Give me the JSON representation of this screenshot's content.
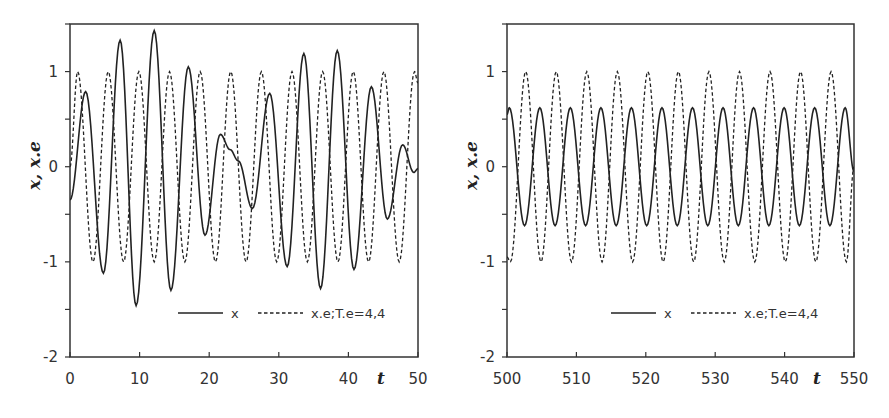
{
  "chart_data": [
    {
      "type": "line",
      "title": "",
      "xlabel": "t",
      "ylabel": "x, x.e",
      "xlim": [
        0,
        50
      ],
      "ylim": [
        -2,
        1.5
      ],
      "xticks": [
        0,
        10,
        20,
        30,
        40,
        50
      ],
      "yticks": [
        -2,
        -1,
        0,
        1
      ],
      "yminor_step": 0.5,
      "grid": false,
      "legend_position": "lower-right inside",
      "series": [
        {
          "name": "x",
          "style": "solid",
          "keyframes": [
            [
              0,
              -0.35
            ],
            [
              2.25,
              0.79
            ],
            [
              4.8,
              -1.12
            ],
            [
              7.2,
              1.33
            ],
            [
              9.5,
              -1.46
            ],
            [
              12.1,
              1.43
            ],
            [
              14.5,
              -1.3
            ],
            [
              17.0,
              1.05
            ],
            [
              19.4,
              -0.72
            ],
            [
              21.6,
              0.34
            ],
            [
              23.0,
              0.18
            ],
            [
              24.2,
              0.06
            ],
            [
              26.2,
              -0.44
            ],
            [
              28.7,
              0.77
            ],
            [
              31.2,
              -1.05
            ],
            [
              33.6,
              1.19
            ],
            [
              36.0,
              -1.28
            ],
            [
              38.4,
              1.22
            ],
            [
              40.8,
              -1.08
            ],
            [
              43.3,
              0.84
            ],
            [
              45.6,
              -0.55
            ],
            [
              47.8,
              0.23
            ],
            [
              49.4,
              -0.06
            ],
            [
              50,
              -0.02
            ]
          ]
        },
        {
          "name": "x.e;T.e=4,4",
          "style": "dashed",
          "keyframes": [
            [
              0,
              0
            ],
            [
              1.1,
              1
            ],
            [
              3.3,
              -1
            ],
            [
              5.5,
              1
            ],
            [
              7.7,
              -1
            ],
            [
              9.9,
              1
            ],
            [
              12.1,
              -1
            ],
            [
              14.3,
              1
            ],
            [
              16.5,
              -1
            ],
            [
              18.7,
              1
            ],
            [
              20.9,
              -1
            ],
            [
              23.1,
              1
            ],
            [
              25.3,
              -1
            ],
            [
              27.5,
              1
            ],
            [
              29.7,
              -1
            ],
            [
              31.9,
              1
            ],
            [
              34.1,
              -1
            ],
            [
              36.3,
              1
            ],
            [
              38.5,
              -1
            ],
            [
              40.7,
              1
            ],
            [
              42.9,
              -1
            ],
            [
              45.1,
              1
            ],
            [
              47.3,
              -1
            ],
            [
              49.5,
              1
            ],
            [
              50,
              0.88
            ]
          ]
        }
      ]
    },
    {
      "type": "line",
      "title": "",
      "xlabel": "t",
      "ylabel": "x, x.e",
      "xlim": [
        500,
        550
      ],
      "ylim": [
        -2,
        1.5
      ],
      "xticks": [
        500,
        510,
        520,
        530,
        540,
        550
      ],
      "yticks": [
        -2,
        -1,
        0,
        1
      ],
      "yminor_step": 0.5,
      "grid": false,
      "legend_position": "lower-right inside",
      "series": [
        {
          "name": "x",
          "style": "solid",
          "keyframes": [
            [
              500,
              0.55
            ],
            [
              500.33,
              0.62
            ],
            [
              502.53,
              -0.62
            ],
            [
              504.73,
              0.62
            ],
            [
              506.93,
              -0.62
            ],
            [
              509.13,
              0.62
            ],
            [
              511.33,
              -0.62
            ],
            [
              513.53,
              0.62
            ],
            [
              515.73,
              -0.62
            ],
            [
              517.93,
              0.62
            ],
            [
              520.13,
              -0.62
            ],
            [
              522.33,
              0.62
            ],
            [
              524.53,
              -0.62
            ],
            [
              526.73,
              0.62
            ],
            [
              528.93,
              -0.62
            ],
            [
              531.13,
              0.62
            ],
            [
              533.33,
              -0.62
            ],
            [
              535.53,
              0.62
            ],
            [
              537.73,
              -0.62
            ],
            [
              539.93,
              0.62
            ],
            [
              542.13,
              -0.62
            ],
            [
              544.33,
              0.62
            ],
            [
              546.53,
              -0.62
            ],
            [
              548.73,
              0.62
            ],
            [
              550,
              -0.05
            ]
          ]
        },
        {
          "name": "x.e;T.e=4,4",
          "style": "dashed",
          "keyframes": [
            [
              500,
              -0.95
            ],
            [
              500.5,
              -1
            ],
            [
              502.7,
              1
            ],
            [
              504.9,
              -1
            ],
            [
              507.1,
              1
            ],
            [
              509.3,
              -1
            ],
            [
              511.5,
              1
            ],
            [
              513.7,
              -1
            ],
            [
              515.9,
              1
            ],
            [
              518.1,
              -1
            ],
            [
              520.3,
              1
            ],
            [
              522.5,
              -1
            ],
            [
              524.7,
              1
            ],
            [
              526.9,
              -1
            ],
            [
              529.1,
              1
            ],
            [
              531.3,
              -1
            ],
            [
              533.5,
              1
            ],
            [
              535.7,
              -1
            ],
            [
              537.9,
              1
            ],
            [
              540.1,
              -1
            ],
            [
              542.3,
              1
            ],
            [
              544.5,
              -1
            ],
            [
              546.7,
              1
            ],
            [
              548.9,
              -1
            ],
            [
              550,
              0
            ]
          ]
        }
      ]
    }
  ],
  "panels": [
    {
      "ylabel": "x, x.e",
      "xlabel": "t",
      "xtick_labels": [
        "0",
        "10",
        "20",
        "30",
        "40",
        "50"
      ],
      "ytick_labels": [
        "-2",
        "-1",
        "0",
        "1"
      ],
      "legend": {
        "solid_label": "x",
        "dashed_label": "x.e;T.e=4,4"
      }
    },
    {
      "ylabel": "x, x.e",
      "xlabel": "t",
      "xtick_labels": [
        "500",
        "510",
        "520",
        "530",
        "540",
        "550"
      ],
      "ytick_labels": [
        "-2",
        "-1",
        "0",
        "1"
      ],
      "legend": {
        "solid_label": "x",
        "dashed_label": "x.e;T.e=4,4"
      }
    }
  ],
  "colors": {
    "line": "#222222",
    "axis": "#333333",
    "background": "#ffffff"
  }
}
